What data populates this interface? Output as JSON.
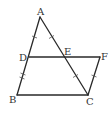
{
  "diagram": {
    "type": "geometry",
    "points": {
      "A": {
        "label": "A",
        "x": 40,
        "y": 17
      },
      "B": {
        "label": "B",
        "x": 17,
        "y": 95
      },
      "C": {
        "label": "C",
        "x": 88,
        "y": 95
      },
      "D": {
        "label": "D",
        "x": 29,
        "y": 57
      },
      "E": {
        "label": "E",
        "x": 63,
        "y": 57
      },
      "F": {
        "label": "F",
        "x": 100,
        "y": 57
      }
    },
    "segments": [
      "AB",
      "AC",
      "BC",
      "DF",
      "CF"
    ],
    "tick_marks": {
      "AD": 1,
      "DB": 2,
      "AE": 1,
      "EC": 1,
      "CF": 1
    },
    "colors": {
      "line": "#2a2a2a",
      "label": "#333333"
    }
  }
}
